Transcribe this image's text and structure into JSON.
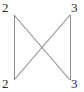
{
  "diagram": {
    "type": "vertex-labeled-graph",
    "background_color": "#ffffff",
    "edge_color": "#8d8d8d",
    "label_color": "#2b2b2b",
    "edge_width": 1,
    "vertices": [
      {
        "id": "top-left",
        "label": "2",
        "x": 14,
        "y": 15
      },
      {
        "id": "top-right",
        "label": "3",
        "x": 70,
        "y": 15
      },
      {
        "id": "bottom-left",
        "label": "2",
        "x": 14,
        "y": 80
      },
      {
        "id": "bottom-right",
        "label": "3",
        "x": 70,
        "y": 80
      }
    ],
    "edges": [
      {
        "id": "left-side",
        "from": "top-left",
        "to": "bottom-left"
      },
      {
        "id": "right-side",
        "from": "top-right",
        "to": "bottom-right"
      },
      {
        "id": "diagonal-tl-br",
        "from": "top-left",
        "to": "bottom-right"
      },
      {
        "id": "diagonal-tr-bl",
        "from": "top-right",
        "to": "bottom-left"
      }
    ],
    "labels": {
      "top_left": "2",
      "top_right": "3",
      "bottom_left": "2",
      "bottom_right": "3"
    }
  }
}
